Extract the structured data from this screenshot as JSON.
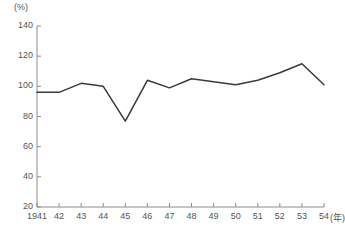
{
  "chart_data": {
    "type": "line",
    "title": "",
    "subtitle": "",
    "xlabel": "(年)",
    "ylabel": "(%)",
    "unit_label": "(%)",
    "x_unit_label": "(年)",
    "categories": [
      "1941",
      "42",
      "43",
      "44",
      "45",
      "46",
      "47",
      "48",
      "49",
      "50",
      "51",
      "52",
      "53",
      "54"
    ],
    "x": [
      1941,
      1942,
      1943,
      1944,
      1945,
      1946,
      1947,
      1948,
      1949,
      1950,
      1951,
      1952,
      1953,
      1954
    ],
    "values": [
      96,
      96,
      102,
      100,
      77,
      104,
      99,
      105,
      103,
      101,
      104,
      109,
      115,
      101
    ],
    "series": [
      {
        "name": "",
        "values": [
          96,
          96,
          102,
          100,
          77,
          104,
          99,
          105,
          103,
          101,
          104,
          109,
          115,
          101
        ]
      }
    ],
    "ylim": [
      20,
      140
    ],
    "xlim": [
      1941,
      1954
    ],
    "yticks": [
      20,
      40,
      60,
      80,
      100,
      120,
      140
    ],
    "ytick_labels": [
      "20",
      "40",
      "60",
      "80",
      "100",
      "120",
      "140"
    ],
    "xtick_labels": [
      "1941",
      "42",
      "43",
      "44",
      "45",
      "46",
      "47",
      "48",
      "49",
      "50",
      "51",
      "52",
      "53",
      "54"
    ],
    "grid": false,
    "legend": null,
    "legend_position": "none",
    "line_color": "#3a3a3a",
    "axis_color": "#8c8c8c",
    "text_color": "#555555",
    "background": "#ffffff",
    "markers": false,
    "annotations": []
  }
}
